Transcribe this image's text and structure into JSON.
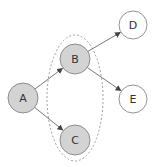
{
  "diagram": {
    "type": "directed-graph",
    "colors": {
      "highlighted_fill": "#d3d3d3",
      "plain_fill": "#ffffff",
      "stroke": "#777777",
      "edge": "#555555",
      "group_stroke": "#888888"
    },
    "nodes": [
      {
        "id": "A",
        "label": "A",
        "cx": 23,
        "cy": 98,
        "r": 15,
        "highlighted": true
      },
      {
        "id": "B",
        "label": "B",
        "cx": 75,
        "cy": 59,
        "r": 15,
        "highlighted": true
      },
      {
        "id": "C",
        "label": "C",
        "cx": 75,
        "cy": 140,
        "r": 15,
        "highlighted": true
      },
      {
        "id": "D",
        "label": "D",
        "cx": 133,
        "cy": 25,
        "r": 14,
        "highlighted": false
      },
      {
        "id": "E",
        "label": "E",
        "cx": 133,
        "cy": 99,
        "r": 14,
        "highlighted": false
      }
    ],
    "edges": [
      {
        "from": "A",
        "to": "B"
      },
      {
        "from": "A",
        "to": "C"
      },
      {
        "from": "B",
        "to": "D"
      },
      {
        "from": "B",
        "to": "E"
      }
    ],
    "group": {
      "members": [
        "B",
        "C"
      ],
      "shape": "dashed-ellipse",
      "cx": 75,
      "cy": 98,
      "rx": 28,
      "ry": 63
    }
  }
}
